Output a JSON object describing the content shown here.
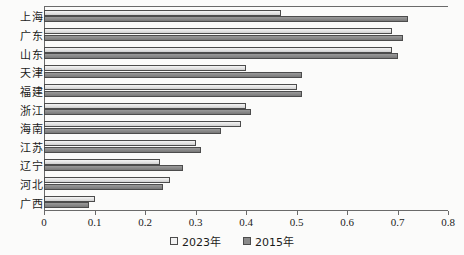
{
  "chart_data": {
    "type": "bar",
    "orientation": "horizontal",
    "title": "",
    "xlabel": "",
    "ylabel": "",
    "xlim": [
      0,
      0.8
    ],
    "xticks": [
      "0",
      "0.1",
      "0.2",
      "0.3",
      "0.4",
      "0.5",
      "0.6",
      "0.7",
      "0.8"
    ],
    "xtick_values": [
      0,
      0.1,
      0.2,
      0.3,
      0.4,
      0.5,
      0.6,
      0.7,
      0.8
    ],
    "grid": false,
    "legend_position": "bottom-center",
    "categories": [
      "上海",
      "广东",
      "山东",
      "天津",
      "福建",
      "浙江",
      "海南",
      "江苏",
      "辽宁",
      "河北",
      "广西"
    ],
    "series": [
      {
        "name": "2023年",
        "color": "#e9e9e9",
        "values": [
          0.47,
          0.69,
          0.69,
          0.4,
          0.5,
          0.4,
          0.39,
          0.3,
          0.23,
          0.25,
          0.1
        ]
      },
      {
        "name": "2015年",
        "color": "#8a8a8a",
        "values": [
          0.72,
          0.71,
          0.7,
          0.51,
          0.51,
          0.41,
          0.35,
          0.31,
          0.275,
          0.235,
          0.09
        ]
      }
    ]
  },
  "legend": {
    "items": [
      {
        "label": "2023年",
        "swatch": "light-square-icon"
      },
      {
        "label": "2015年",
        "swatch": "dark-square-icon"
      }
    ]
  },
  "axis": {
    "frame_color": "#6a6a6a",
    "bar_border_color": "#4c4c4c"
  }
}
